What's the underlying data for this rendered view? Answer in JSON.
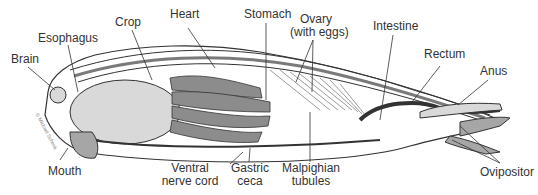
{
  "diagram": {
    "copyright": "© Michael Schenk",
    "labels": {
      "brain": "Brain",
      "esophagus": "Esophagus",
      "crop": "Crop",
      "heart": "Heart",
      "stomach": "Stomach",
      "ovary_line1": "Ovary",
      "ovary_line2": "(with eggs)",
      "intestine": "Intestine",
      "rectum": "Rectum",
      "anus": "Anus",
      "mouth": "Mouth",
      "ventral_line1": "Ventral",
      "ventral_line2": "nerve cord",
      "gastric_line1": "Gastric",
      "gastric_line2": "ceca",
      "malpighian_line1": "Malpighian",
      "malpighian_line2": "tubules",
      "ovipositor": "Ovipositor"
    },
    "colors": {
      "outline": "#333333",
      "light_fill": "#d9d9d9",
      "mid_fill": "#a6a6a6",
      "dark_fill": "#7a7a7a",
      "label_text": "#333333"
    }
  }
}
